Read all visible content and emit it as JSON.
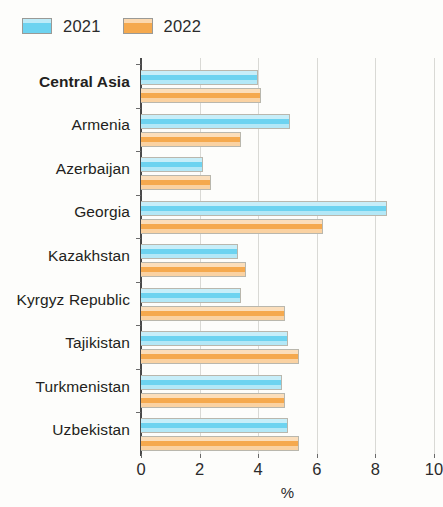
{
  "chart_data": {
    "type": "bar",
    "orientation": "horizontal",
    "title": "",
    "xlabel": "%",
    "ylabel": "",
    "xlim": [
      0,
      10
    ],
    "xticks": [
      0,
      2,
      4,
      6,
      8,
      10
    ],
    "xtick_labels": [
      "0",
      "2",
      "4",
      "6",
      "8",
      "10"
    ],
    "grid": "vertical",
    "legend_position": "top-left",
    "categories": [
      "Central Asia",
      "Armenia",
      "Azerbaijan",
      "Georgia",
      "Kazakhstan",
      "Kyrgyz Republic",
      "Tajikistan",
      "Turkmenistan",
      "Uzbekistan"
    ],
    "emphasized_categories": [
      "Central Asia"
    ],
    "series": [
      {
        "name": "2021",
        "color": "#6DD3F0",
        "values": [
          4.0,
          5.1,
          2.1,
          8.4,
          3.3,
          3.4,
          5.0,
          4.8,
          5.0
        ]
      },
      {
        "name": "2022",
        "color": "#F5A94E",
        "values": [
          4.1,
          3.4,
          2.4,
          6.2,
          3.6,
          4.9,
          5.4,
          4.9,
          5.4
        ]
      }
    ]
  },
  "legend": {
    "items": [
      {
        "label": "2021",
        "color": "#6DD3F0"
      },
      {
        "label": "2022",
        "color": "#F5A94E"
      }
    ]
  },
  "axis": {
    "x_title": "%"
  }
}
